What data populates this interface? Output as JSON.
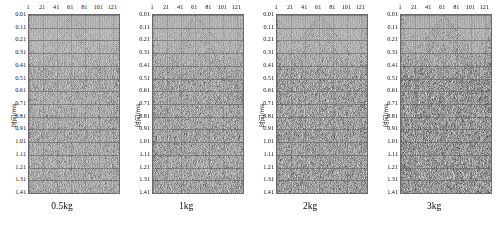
{
  "figure": {
    "type": "seismic-wavefield-panels",
    "panel_count": 4
  },
  "axes": {
    "ylabel": "时间/ms",
    "xlabel": "",
    "x_ticks": [
      "1",
      "21",
      "41",
      "61",
      "81",
      "101",
      "121"
    ],
    "x_tick_values": [
      1,
      21,
      41,
      61,
      81,
      101,
      121
    ],
    "x_range": [
      1,
      129
    ],
    "y_ticks": [
      "0.01",
      "0.11",
      "0.21",
      "0.31",
      "0.41",
      "0.51",
      "0.61",
      "0.71",
      "0.81",
      "0.91",
      "1.01",
      "1.11",
      "1.21",
      "1.31",
      "1.41"
    ],
    "y_tick_values": [
      0.01,
      0.11,
      0.21,
      0.31,
      0.41,
      0.51,
      0.61,
      0.71,
      0.81,
      0.91,
      1.01,
      1.11,
      1.21,
      1.31,
      1.41
    ],
    "y_range": [
      0.01,
      1.41
    ],
    "grid": true
  },
  "panels": [
    {
      "caption": "0.5kg",
      "charge_kg": 0.5,
      "apex_trace": 61,
      "apex_time_ms": 0.01,
      "density": 0.42,
      "amplitude": 0.78
    },
    {
      "caption": "1kg",
      "charge_kg": 1,
      "apex_trace": 61,
      "apex_time_ms": 0.01,
      "density": 0.47,
      "amplitude": 0.86
    },
    {
      "caption": "2kg",
      "charge_kg": 2,
      "apex_trace": 61,
      "apex_time_ms": 0.01,
      "density": 0.52,
      "amplitude": 0.92
    },
    {
      "caption": "3kg",
      "charge_kg": 3,
      "apex_trace": 61,
      "apex_time_ms": 0.01,
      "density": 0.58,
      "amplitude": 1.0
    }
  ],
  "chart_data": {
    "type": "heatmap",
    "title": "",
    "subtitle": "",
    "xlabel": "",
    "ylabel": "时间/ms",
    "xlim": [
      1,
      129
    ],
    "ylim": [
      0.01,
      1.41
    ],
    "grid": true,
    "legend": "none",
    "categories": [
      "0.5kg",
      "1kg",
      "2kg",
      "3kg"
    ],
    "series": [
      {
        "name": "0.5kg",
        "apex_trace": 61,
        "events": [
          {
            "name": "direct-wave-left",
            "t0_ms": 0.01,
            "slope_ms_per_trace": 0.0065,
            "polarity": "negative"
          },
          {
            "name": "direct-wave-right",
            "t0_ms": 0.01,
            "slope_ms_per_trace": 0.0065,
            "polarity": "positive"
          },
          {
            "name": "refraction-branch-left",
            "t_at_trace1_ms": 0.41,
            "t_at_apex_ms": 0.02
          },
          {
            "name": "refraction-branch-right",
            "t_at_trace121_ms": 0.36,
            "t_at_apex_ms": 0.02
          },
          {
            "name": "late-linear-left",
            "t_at_apex_ms": 0.05,
            "t_at_trace1_ms": 1.22
          },
          {
            "name": "late-linear-right",
            "t_at_apex_ms": 0.05,
            "t_at_trace121_ms": 1.26
          }
        ]
      },
      {
        "name": "1kg",
        "apex_trace": 61,
        "events": [
          {
            "name": "direct-wave-left",
            "t0_ms": 0.01,
            "slope_ms_per_trace": 0.0068,
            "polarity": "negative"
          },
          {
            "name": "direct-wave-right",
            "t0_ms": 0.01,
            "slope_ms_per_trace": 0.0068,
            "polarity": "positive"
          },
          {
            "name": "refraction-branch-left",
            "t_at_trace1_ms": 0.43,
            "t_at_apex_ms": 0.02
          },
          {
            "name": "refraction-branch-right",
            "t_at_trace121_ms": 0.33,
            "t_at_apex_ms": 0.02
          },
          {
            "name": "late-linear-left",
            "t_at_apex_ms": 0.05,
            "t_at_trace1_ms": 1.34
          },
          {
            "name": "late-linear-right",
            "t_at_apex_ms": 0.05,
            "t_at_trace121_ms": 1.14
          }
        ]
      },
      {
        "name": "2kg",
        "apex_trace": 61,
        "events": [
          {
            "name": "direct-wave-left",
            "t0_ms": 0.01,
            "slope_ms_per_trace": 0.007,
            "polarity": "negative"
          },
          {
            "name": "direct-wave-right",
            "t0_ms": 0.01,
            "slope_ms_per_trace": 0.007,
            "polarity": "positive"
          },
          {
            "name": "refraction-branch-left",
            "t_at_trace1_ms": 0.45,
            "t_at_apex_ms": 0.02
          },
          {
            "name": "refraction-branch-right",
            "t_at_trace121_ms": 0.34,
            "t_at_apex_ms": 0.02
          },
          {
            "name": "late-linear-left",
            "t_at_apex_ms": 0.05,
            "t_at_trace1_ms": 1.05
          },
          {
            "name": "late-linear-right",
            "t_at_apex_ms": 0.05,
            "t_at_trace121_ms": 1.18
          }
        ]
      },
      {
        "name": "3kg",
        "apex_trace": 61,
        "events": [
          {
            "name": "direct-wave-left",
            "t0_ms": 0.01,
            "slope_ms_per_trace": 0.0072,
            "polarity": "negative"
          },
          {
            "name": "direct-wave-right",
            "t0_ms": 0.01,
            "slope_ms_per_trace": 0.0072,
            "polarity": "positive"
          },
          {
            "name": "secondary-apex",
            "trace": 77,
            "t_ms": 0.08
          },
          {
            "name": "refraction-branch-left",
            "t_at_trace1_ms": 0.44,
            "t_at_apex_ms": 0.02
          },
          {
            "name": "refraction-branch-right",
            "t_at_trace121_ms": 0.37,
            "t_at_apex_ms": 0.02
          },
          {
            "name": "late-linear-left",
            "t_at_apex_ms": 0.05,
            "t_at_trace1_ms": 1.3
          },
          {
            "name": "late-linear-right",
            "t_at_apex_ms": 0.05,
            "t_at_trace121_ms": 1.22
          }
        ]
      }
    ]
  },
  "colors": {
    "trace": "#1a1a1a",
    "background": "#ffffff",
    "grid": "#5a5a5a",
    "axis": "#6a6a6a",
    "text": "#111111"
  }
}
